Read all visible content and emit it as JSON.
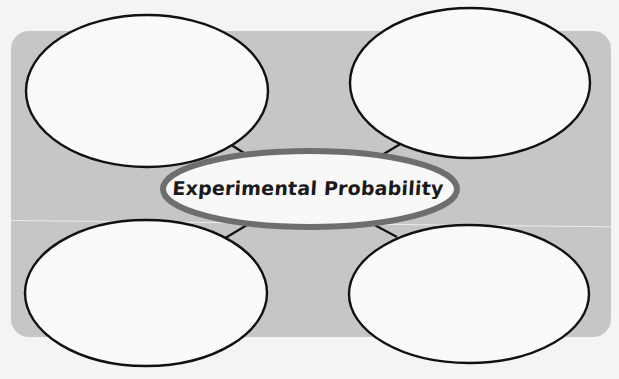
{
  "diagram": {
    "type": "concept-map",
    "center": {
      "label": "Experimental Probability",
      "fill": "#f8f8f8",
      "border": "#6e6e6e"
    },
    "panel_color": "#c6c6c6",
    "page_color": "#f4f4f2",
    "nodes": [
      {
        "id": "top-left",
        "label": ""
      },
      {
        "id": "top-right",
        "label": ""
      },
      {
        "id": "bottom-left",
        "label": ""
      },
      {
        "id": "bottom-right",
        "label": ""
      }
    ],
    "node_fill": "#fafafa",
    "node_stroke": "#111111"
  }
}
